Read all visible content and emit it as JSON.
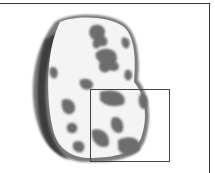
{
  "image": {
    "description": "Grayscale illustration of a rounded food slice cross-section with dark mottled patches and a rectangular zoom box outlined over the lower right portion",
    "colors": {
      "frame": "#333333",
      "rind": "#555555",
      "interior": "#f4f4f4",
      "patches": "#6f6f6f",
      "box": "#444444"
    }
  }
}
